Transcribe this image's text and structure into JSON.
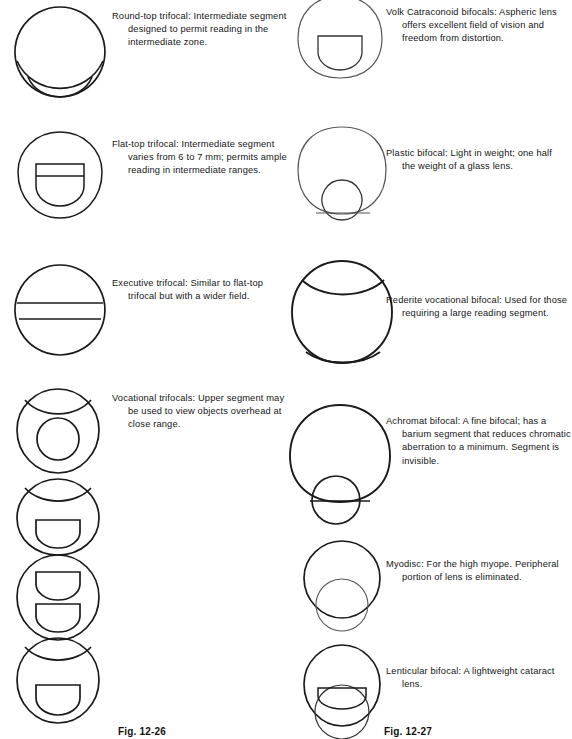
{
  "page": {
    "width": 552,
    "height": 739,
    "background": "#ffffff",
    "ink": "#1a1a1a"
  },
  "figure_labels": {
    "left": "Fig. 12-26",
    "right": "Fig. 12-27"
  },
  "left_column": {
    "entries": [
      {
        "id": "round-top-trifocal",
        "caption": "Round-top trifocal:  Intermediate segment designed to permit reading in the intermediate zone.",
        "lens_type": "round-top-trifocal",
        "caption_x": 112,
        "caption_y": 10,
        "caption_width": 160,
        "fig_x": 12,
        "fig_y": 4
      },
      {
        "id": "flat-top-trifocal",
        "caption": "Flat-top trifocal:  Intermediate segment varies from 6 to 7 mm; permits ample reading in intermediate ranges.",
        "lens_type": "flat-top-trifocal",
        "caption_x": 112,
        "caption_y": 138,
        "caption_width": 160,
        "fig_x": 12,
        "fig_y": 128
      },
      {
        "id": "executive-trifocal",
        "caption": "Executive trifocal:  Similar to flat-top trifocal but with a wider field.",
        "lens_type": "executive-trifocal",
        "caption_x": 112,
        "caption_y": 277,
        "caption_width": 160,
        "fig_x": 12,
        "fig_y": 262
      },
      {
        "id": "vocational-trifocals",
        "caption": "Vocational trifocals:  Upper segment may be used to view objects overhead at close range.",
        "lens_type": "vocational-trifocal-a",
        "caption_x": 112,
        "caption_y": 392,
        "caption_width": 160,
        "fig_x": 12,
        "fig_y": 386
      },
      {
        "id": "vocational-trifocal-b",
        "caption": "",
        "lens_type": "vocational-trifocal-b",
        "caption_x": 0,
        "caption_y": 0,
        "caption_width": 0,
        "fig_x": 12,
        "fig_y": 476
      },
      {
        "id": "vocational-trifocal-c",
        "caption": "",
        "lens_type": "vocational-trifocal-c",
        "caption_x": 0,
        "caption_y": 0,
        "caption_width": 0,
        "fig_x": 12,
        "fig_y": 552
      },
      {
        "id": "vocational-trifocal-d",
        "caption": "",
        "lens_type": "vocational-trifocal-d",
        "caption_x": 0,
        "caption_y": 0,
        "caption_width": 0,
        "fig_x": 12,
        "fig_y": 635
      }
    ]
  },
  "right_column": {
    "entries": [
      {
        "id": "volk-catraconoid-bifocals",
        "caption": "Volk Catraconoid bifocals: Aspheric lens offers excellent field of vision and freedom from distortion.",
        "lens_type": "volk-catraconoid-bifocal",
        "caption_x": 110,
        "caption_y": 6,
        "caption_width": 166,
        "fig_x": 14,
        "fig_y": -8
      },
      {
        "id": "plastic-bifocal",
        "caption": "Plastic bifocal:  Light in weight; one half the weight of a glass lens.",
        "lens_type": "plastic-bifocal",
        "caption_x": 110,
        "caption_y": 147,
        "caption_width": 166,
        "fig_x": 14,
        "fig_y": 122
      },
      {
        "id": "rederite-vocational-bifocal",
        "caption": "Rederite vocational bifocal: Used for those requiring a large reading segment.",
        "lens_type": "rederite-vocational-bifocal",
        "caption_x": 110,
        "caption_y": 294,
        "caption_width": 166,
        "fig_x": 10,
        "fig_y": 256
      },
      {
        "id": "achromat-bifocal",
        "caption": "Achromat bifocal:  A fine bifocal; has a barium segment that reduces chromatic aberration to a minimum. Segment is invisible.",
        "lens_type": "achromat-bifocal",
        "caption_x": 110,
        "caption_y": 415,
        "caption_width": 168,
        "fig_x": 8,
        "fig_y": 400
      },
      {
        "id": "myodisc",
        "caption": "Myodisc:  For the high myope. Peripheral portion of lens is eliminated.",
        "lens_type": "myodisc",
        "caption_x": 110,
        "caption_y": 558,
        "caption_width": 166,
        "fig_x": 24,
        "fig_y": 538
      },
      {
        "id": "lenticular-bifocal",
        "caption": "Lenticular bifocal:  A lightweight cataract lens.",
        "lens_type": "lenticular-bifocal",
        "caption_x": 110,
        "caption_y": 665,
        "caption_width": 166,
        "fig_x": 24,
        "fig_y": 642
      }
    ]
  }
}
